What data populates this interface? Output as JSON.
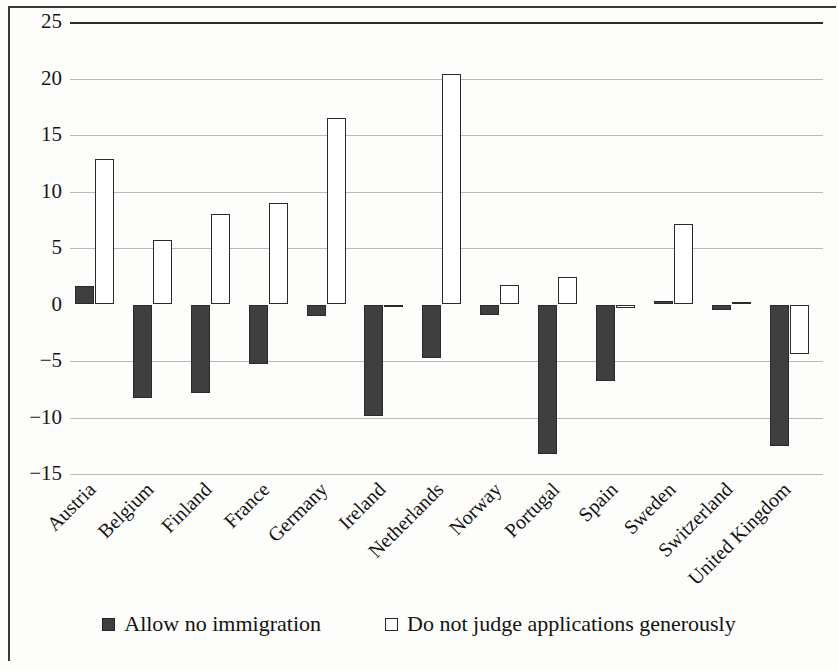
{
  "chart_data": {
    "type": "bar",
    "title": "",
    "subtitle": "",
    "xlabel": "",
    "ylabel": "",
    "ylim": [
      -15,
      25
    ],
    "ytick_labels": [
      "25",
      "20",
      "15",
      "10",
      "5",
      "0",
      "−5",
      "−10",
      "−15"
    ],
    "yticks": [
      25,
      20,
      15,
      10,
      5,
      0,
      -5,
      -10,
      -15
    ],
    "grid": true,
    "legend_position": "bottom",
    "categories": [
      "Austria",
      "Belgium",
      "Finland",
      "France",
      "Germany",
      "Ireland",
      "Netherlands",
      "Norway",
      "Portugal",
      "Spain",
      "Sweden",
      "Switzerland",
      "United Kingdom"
    ],
    "series": [
      {
        "name": "Allow no immigration",
        "style": "dark",
        "color": "#3f3f3f",
        "values": [
          1.6,
          -8.3,
          -7.8,
          -5.3,
          -1.0,
          -9.9,
          -4.7,
          -0.9,
          -13.2,
          -6.8,
          0.3,
          -0.5,
          -12.5
        ]
      },
      {
        "name": "Do not judge applications generously",
        "style": "light",
        "color": "#ffffff",
        "values": [
          12.9,
          5.7,
          8.0,
          9.0,
          16.5,
          -0.2,
          20.4,
          1.7,
          2.4,
          -0.3,
          7.1,
          0.2,
          -4.4
        ]
      }
    ]
  },
  "legend": {
    "entries": [
      {
        "label": "Allow no immigration",
        "swatch": "dark-square-icon"
      },
      {
        "label": "Do not judge applications generously",
        "swatch": "open-square-icon"
      }
    ]
  }
}
